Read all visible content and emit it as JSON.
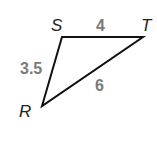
{
  "diagram": {
    "type": "triangle",
    "vertices": [
      {
        "name": "S",
        "label": "S"
      },
      {
        "name": "T",
        "label": "T"
      },
      {
        "name": "R",
        "label": "R"
      }
    ],
    "sides": [
      {
        "name": "ST",
        "label": "4"
      },
      {
        "name": "SR",
        "label": "3.5"
      },
      {
        "name": "RT",
        "label": "6"
      }
    ],
    "colors": {
      "stroke": "#111111",
      "vertex_label": "#222222",
      "side_label": "#7a7a7a"
    }
  }
}
